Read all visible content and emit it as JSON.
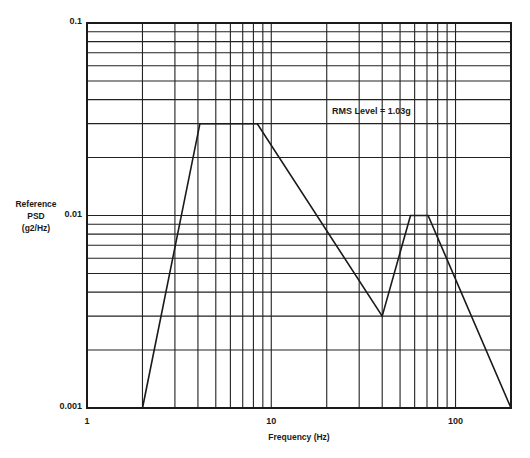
{
  "chart_data": {
    "type": "line",
    "title": "",
    "xlabel": "Frequency (Hz)",
    "ylabel": "Reference PSD (g2/Hz)",
    "ylabel_lines": [
      "Reference",
      "PSD",
      "(g2/Hz)"
    ],
    "x_scale": "log",
    "y_scale": "log",
    "xlim": [
      1,
      200
    ],
    "ylim": [
      0.001,
      0.1
    ],
    "x_ticks": [
      1,
      10,
      100
    ],
    "x_tick_labels": [
      "1",
      "10",
      "100"
    ],
    "y_ticks": [
      0.001,
      0.01,
      0.1
    ],
    "y_tick_labels": [
      "0.001",
      "0.01",
      "0.1"
    ],
    "grid": true,
    "x_minor_grid": [
      2,
      3,
      4,
      5,
      6,
      7,
      8,
      9,
      20,
      30,
      40,
      50,
      60,
      70,
      80,
      90
    ],
    "y_minor_grid": [
      0.002,
      0.003,
      0.004,
      0.005,
      0.006,
      0.007,
      0.008,
      0.009,
      0.02,
      0.03,
      0.04,
      0.05,
      0.06,
      0.07,
      0.08,
      0.09
    ],
    "series": [
      {
        "name": "Reference PSD",
        "x": [
          2,
          4.1,
          8.4,
          40,
          57,
          71,
          200
        ],
        "y": [
          0.001,
          0.03,
          0.03,
          0.003,
          0.01,
          0.01,
          0.001
        ]
      }
    ],
    "annotations": [
      {
        "text": "RMS Level = 1.03g",
        "x_px": 332,
        "y_px": 106
      }
    ],
    "legend": null
  },
  "layout": {
    "plot": {
      "left": 87,
      "top": 23,
      "right": 511,
      "bottom": 408
    },
    "line_color": "#1a1a1a",
    "grid_color": "#222222"
  }
}
